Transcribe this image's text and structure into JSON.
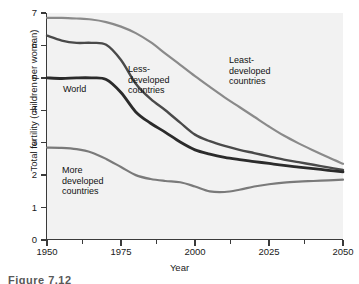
{
  "figure": {
    "caption_partial": "Figure 7.12"
  },
  "chart_data": {
    "type": "line",
    "title": "",
    "xlabel": "Year",
    "ylabel": "Total fertility (children per woman)",
    "xlim": [
      1950,
      2050
    ],
    "ylim": [
      0,
      7
    ],
    "grid": false,
    "legend_position": "inline-annotations",
    "xticks": [
      1950,
      1975,
      2000,
      2025,
      2050
    ],
    "xticklabels": [
      "1950",
      "1975",
      "2000",
      "2025",
      "2050"
    ],
    "xminorticks": [
      1962,
      1987,
      2012,
      2037
    ],
    "yticks": [
      0,
      1,
      2,
      3,
      4,
      5,
      6,
      7
    ],
    "yticklabels": [
      "0",
      "1",
      "2",
      "3",
      "4",
      "5",
      "6",
      "7"
    ],
    "x": [
      1950,
      1955,
      1960,
      1965,
      1970,
      1975,
      1980,
      1985,
      1990,
      1995,
      2000,
      2005,
      2010,
      2015,
      2020,
      2025,
      2030,
      2035,
      2040,
      2045,
      2050
    ],
    "series": [
      {
        "name": "Least-developed countries",
        "color": "#8a8a8a",
        "width": 2.2,
        "values": [
          6.85,
          6.85,
          6.83,
          6.8,
          6.72,
          6.58,
          6.38,
          6.1,
          5.75,
          5.4,
          5.05,
          4.72,
          4.4,
          4.1,
          3.8,
          3.5,
          3.22,
          2.98,
          2.76,
          2.55,
          2.35
        ]
      },
      {
        "name": "Less-developed countries",
        "color": "#4a4a4a",
        "width": 2.4,
        "values": [
          6.3,
          6.15,
          6.08,
          6.08,
          6.02,
          5.55,
          4.82,
          4.35,
          4.0,
          3.62,
          3.25,
          3.05,
          2.9,
          2.78,
          2.68,
          2.58,
          2.48,
          2.4,
          2.32,
          2.24,
          2.16
        ]
      },
      {
        "name": "World",
        "color": "#2b2b2b",
        "width": 2.8,
        "values": [
          5.0,
          4.98,
          5.0,
          5.0,
          4.95,
          4.55,
          3.95,
          3.6,
          3.32,
          3.02,
          2.78,
          2.65,
          2.55,
          2.48,
          2.42,
          2.36,
          2.3,
          2.25,
          2.2,
          2.15,
          2.1
        ]
      },
      {
        "name": "More developed countries",
        "color": "#7a7a7a",
        "width": 2.2,
        "values": [
          2.85,
          2.84,
          2.8,
          2.7,
          2.5,
          2.25,
          2.0,
          1.88,
          1.82,
          1.78,
          1.65,
          1.5,
          1.48,
          1.55,
          1.65,
          1.72,
          1.77,
          1.8,
          1.82,
          1.84,
          1.86
        ]
      }
    ],
    "annotations": [
      {
        "id": "world",
        "text": "World"
      },
      {
        "id": "less",
        "line1": "Less-",
        "line2": "developed",
        "line3": "countries"
      },
      {
        "id": "least",
        "line1": "Least-",
        "line2": "developed",
        "line3": "countries"
      },
      {
        "id": "more",
        "line1": "More",
        "line2": "developed",
        "line3": "countries"
      }
    ]
  }
}
